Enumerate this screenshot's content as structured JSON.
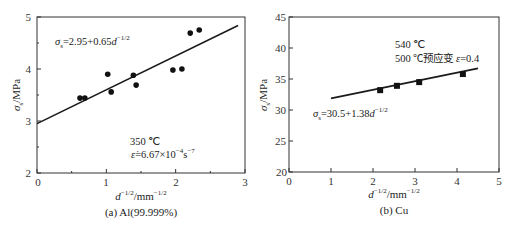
{
  "chart_data": [
    {
      "type": "scatter",
      "panel": "a",
      "caption": "(a) Al(99.999%)",
      "xlabel": "d^-1/2/mm^-1/2",
      "ylabel": "σs/MPa",
      "xlim": [
        0,
        3
      ],
      "ylim": [
        2,
        5
      ],
      "xticks": [
        "0",
        "1",
        "2",
        "3"
      ],
      "yticks": [
        "2",
        "3",
        "4",
        "5"
      ],
      "marker": "circle",
      "points": {
        "x": [
          0.62,
          0.69,
          1.02,
          1.07,
          1.39,
          1.43,
          1.96,
          2.09,
          2.21,
          2.34
        ],
        "y": [
          3.44,
          3.44,
          3.9,
          3.56,
          3.88,
          3.69,
          3.98,
          4.0,
          4.69,
          4.75
        ]
      },
      "fit_line": {
        "intercept": 2.95,
        "slope": 0.65,
        "x_range": [
          0,
          2.9
        ]
      },
      "annotations": {
        "equation": "σs=2.95+0.65d^-1/2",
        "temperature": "350 ℃",
        "strain_rate": "ε̇=6.67×10^-4 s^-7"
      }
    },
    {
      "type": "scatter",
      "panel": "b",
      "caption": "(b) Cu",
      "xlabel": "d^-1/2/mm^-1/2",
      "ylabel": "σs/MPa",
      "xlim": [
        0,
        5
      ],
      "ylim": [
        20,
        45
      ],
      "xticks": [
        "0",
        "1",
        "2",
        "3",
        "4",
        "5"
      ],
      "yticks": [
        "20",
        "25",
        "30",
        "35",
        "40",
        "45"
      ],
      "marker": "square",
      "points": {
        "x": [
          2.17,
          2.57,
          3.1,
          4.14
        ],
        "y": [
          33.2,
          33.9,
          34.5,
          35.8
        ]
      },
      "fit_line": {
        "intercept": 30.5,
        "slope": 1.38,
        "x_range": [
          1.0,
          4.5
        ]
      },
      "annotations": {
        "equation": "σs=30.5+1.38d^-1/2",
        "temperature": "540 ℃",
        "prestrain": "500 ℃预应变 ε=0.4"
      }
    }
  ],
  "panel_a": {
    "caption": "(a) Al(99.999%)",
    "ylabel_main": "σ",
    "ylabel_sub": "s",
    "ylabel_unit": "/MPa",
    "xlabel_main": "d",
    "xlabel_sup": "−1/2",
    "xlabel_unit": "/mm",
    "xlabel_unit_sup": "−1/2",
    "eq_sigma": "σ",
    "eq_sub": "s",
    "eq_body": "=2.95+0.65",
    "eq_d": "d",
    "eq_sup": "−1/2",
    "temp": "350 ℃",
    "rate_eps": "ε̇",
    "rate_body": "=6.67×10",
    "rate_sup": "−4",
    "rate_s": "s",
    "rate_s_sup": "−7",
    "xticks": [
      "0",
      "1",
      "2",
      "3"
    ],
    "yticks": [
      "2",
      "3",
      "4",
      "5"
    ]
  },
  "panel_b": {
    "caption": "(b) Cu",
    "ylabel_main": "σ",
    "ylabel_sub": "s",
    "ylabel_unit": "/MPa",
    "xlabel_main": "d",
    "xlabel_sup": "−1/2",
    "xlabel_unit": "/mm",
    "xlabel_unit_sup": "−1/2",
    "eq_sigma": "σ",
    "eq_sub": "s",
    "eq_body": "=30.5+1.38",
    "eq_d": "d",
    "eq_sup": "−1/2",
    "temp": "540 ℃",
    "prestrain_text": "500 ℃预应变 ",
    "prestrain_eps": "ε",
    "prestrain_val": "=0.4",
    "xticks": [
      "0",
      "1",
      "2",
      "3",
      "4",
      "5"
    ],
    "yticks": [
      "20",
      "25",
      "30",
      "35",
      "40",
      "45"
    ]
  }
}
